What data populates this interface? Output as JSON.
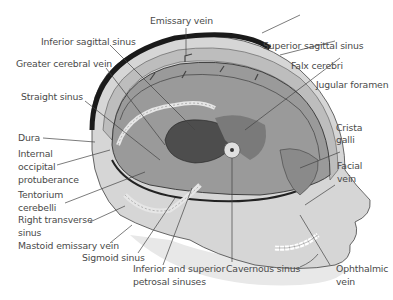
{
  "figure": {
    "colors": {
      "background": "#ffffff",
      "label_text": "#4a4a4a",
      "skin": "#d9d9d9",
      "skull_dark": "#1a1a1a",
      "brain_cavity": "#9a9a9a",
      "sinus_light": "#e6e6e6",
      "inner_dark": "#4d4d4d"
    },
    "labels": {
      "emissary_vein": "Emissary vein",
      "inferior_sagittal_sinus": "Inferior sagittal sinus",
      "superior_sagittal_sinus": "Superior sagittal sinus",
      "greater_cerebral_vein": "Greater cerebral vein",
      "falx_cerebri": "Falx cerebri",
      "jugular_foramen": "Jugular foramen",
      "straight_sinus": "Straight sinus",
      "crista_galli_1": "Crista",
      "crista_galli_2": "galli",
      "dura": "Dura",
      "internal_occipital_protuberance_1": "Internal",
      "internal_occipital_protuberance_2": "occipital",
      "internal_occipital_protuberance_3": "protuberance",
      "facial_vein_1": "Facial",
      "facial_vein_2": "vein",
      "tentorium_cerebelli_1": "Tentorium",
      "tentorium_cerebelli_2": "cerebelli",
      "right_transverse_sinus_1": "Right transverse",
      "right_transverse_sinus_2": "sinus",
      "mastoid_emissary_vein": "Mastoid emissary vein",
      "sigmoid_sinus": "Sigmoid sinus",
      "petrosal_sinuses_1": "Inferior and superior",
      "petrosal_sinuses_2": "petrosal sinuses",
      "cavernous_sinus": "Cavernous sinus",
      "ophthalmic_vein_1": "Ophthalmic",
      "ophthalmic_vein_2": "vein"
    }
  }
}
